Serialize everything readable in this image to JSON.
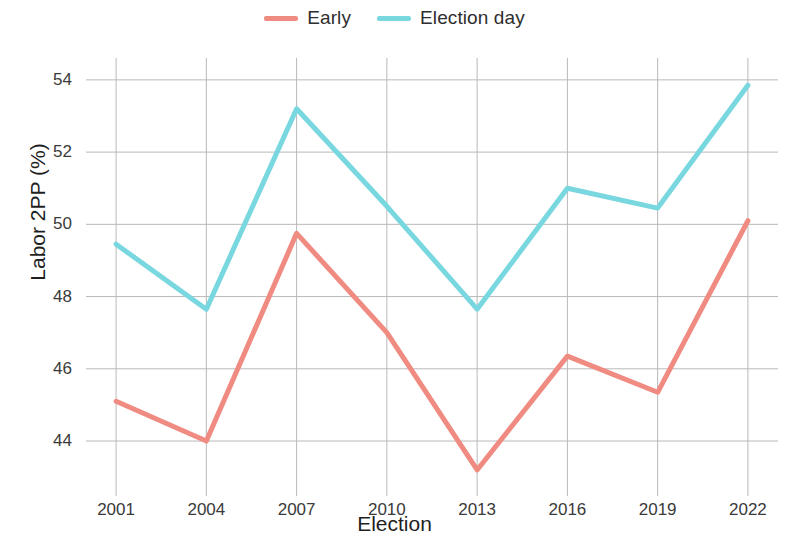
{
  "legend": {
    "position": "top-center",
    "entries": [
      {
        "label": "Early",
        "color": "#F08B82",
        "name": "legend-early"
      },
      {
        "label": "Election day",
        "color": "#79D7E0",
        "name": "legend-election-day"
      }
    ]
  },
  "axes": {
    "x_title": "Election",
    "y_title": "Labor 2PP (%)",
    "x_ticks": [
      "2001",
      "2004",
      "2007",
      "2010",
      "2013",
      "2016",
      "2019",
      "2022"
    ],
    "y_ticks": [
      "44",
      "46",
      "48",
      "50",
      "52",
      "54"
    ]
  },
  "chart_data": {
    "type": "line",
    "title": "",
    "subtitle": "",
    "xlabel": "Election",
    "ylabel": "Labor 2PP (%)",
    "x": [
      2001,
      2004,
      2007,
      2010,
      2013,
      2016,
      2019,
      2022
    ],
    "categories": [
      "2001",
      "2004",
      "2007",
      "2010",
      "2013",
      "2016",
      "2019",
      "2022"
    ],
    "series": [
      {
        "name": "Early",
        "color": "#F08B82",
        "values": [
          45.1,
          44.0,
          49.75,
          47.0,
          43.2,
          46.35,
          45.35,
          50.1
        ]
      },
      {
        "name": "Election day",
        "color": "#79D7E0",
        "values": [
          49.45,
          47.65,
          53.2,
          50.5,
          47.65,
          51.0,
          50.45,
          53.85
        ]
      }
    ],
    "xlim": [
      2000.0,
      2023.0
    ],
    "ylim": [
      42.7,
      54.55
    ],
    "y_ticks": [
      44,
      46,
      48,
      50,
      52,
      54
    ],
    "x_ticks": [
      2001,
      2004,
      2007,
      2010,
      2013,
      2016,
      2019,
      2022
    ],
    "grid": true,
    "grid_color": "#b9b9b9",
    "legend_position": "top-center",
    "line_width": 5,
    "markers": false
  }
}
